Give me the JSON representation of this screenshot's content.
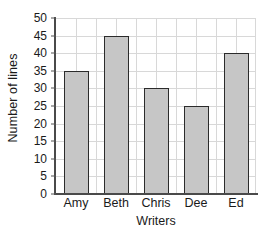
{
  "chart_data": {
    "type": "bar",
    "title": "",
    "xlabel": "Writers",
    "ylabel": "Number of lines",
    "categories": [
      "Amy",
      "Beth",
      "Chris",
      "Dee",
      "Ed"
    ],
    "values": [
      35,
      45,
      30,
      25,
      40
    ],
    "ylim": [
      0,
      50
    ],
    "ytick_step": 5,
    "yticks": [
      0,
      5,
      10,
      15,
      20,
      25,
      30,
      35,
      40,
      45,
      50
    ],
    "ytick_labels": [
      "0",
      "5",
      "10",
      "15",
      "20",
      "25",
      "30",
      "35",
      "40",
      "45",
      "50"
    ],
    "grid": "both",
    "legend": "none",
    "colors": {
      "bar_fill": "#c6c6c6",
      "bar_border": "#2b2b2b",
      "gridline": "#d8d8d8",
      "axis": "#4a4a4a",
      "text": "#1a1a1a",
      "background": "#ffffff"
    }
  }
}
